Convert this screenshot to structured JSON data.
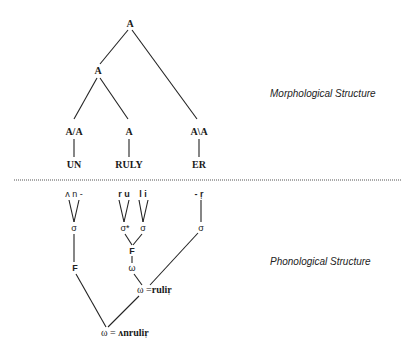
{
  "morphology": {
    "label": "Morphological Structure",
    "root": "A",
    "inner": "A",
    "categories": {
      "prefix": "A/A",
      "stem": "A",
      "suffix": "A\\A"
    },
    "morphemes": {
      "prefix": "UN",
      "stem": "RULY",
      "suffix": "ER"
    }
  },
  "phonology": {
    "label": "Phonological Structure",
    "segments": {
      "un": "ʌ n -",
      "ru": "r u",
      "li": "l i",
      "r": "- r̩"
    },
    "syllables": {
      "un": "σ",
      "ru": "σ*",
      "li": "σ",
      "r": "σ"
    },
    "feet": {
      "left": "F",
      "mid": "F"
    },
    "words": {
      "inner": "ω",
      "rulir_symbol": "ω",
      "rulir_eq": "=",
      "rulir_form": "rulir̩",
      "top_symbol": "ω",
      "top_eq": "=",
      "top_form": "ʌnrulir̩"
    }
  },
  "divider": {
    "style": "dotted",
    "y": 180
  }
}
